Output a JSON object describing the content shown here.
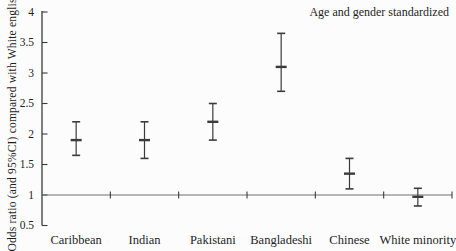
{
  "chart_data": {
    "type": "errorbar",
    "title": "",
    "annotation": "Age and gender standardized",
    "ylabel": "Odds ratio (and 95%CI) compared with White english",
    "categories": [
      "Caribbean",
      "Indian",
      "Pakistani",
      "Bangladeshi",
      "Chinese",
      "White minority"
    ],
    "series": [
      {
        "name": "Odds ratio (95% CI) compared with White English",
        "values": [
          1.9,
          1.9,
          2.2,
          3.1,
          1.35,
          0.97
        ],
        "ci_low": [
          1.65,
          1.6,
          1.9,
          2.7,
          1.1,
          0.82
        ],
        "ci_high": [
          2.2,
          2.2,
          2.5,
          3.65,
          1.6,
          1.11
        ]
      }
    ],
    "ylim": [
      0.5,
      4
    ],
    "yticks": [
      0.5,
      1,
      1.5,
      2,
      2.5,
      3,
      3.5,
      4
    ],
    "reference_line": 1,
    "grid": false,
    "legend_position": "none",
    "colors": {
      "axis": "#3b3b3b",
      "text": "#1e1e1e",
      "reference_line": "#6f6f6f",
      "errorbar": "#3b3b3b"
    }
  }
}
